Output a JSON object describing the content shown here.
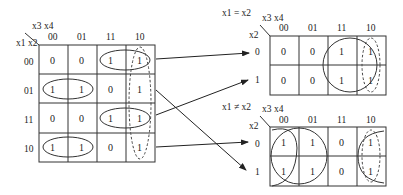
{
  "main_map": {
    "corner_cols_label": "x3 x4",
    "corner_rows_label": "x1 x2",
    "col_headers": [
      "00",
      "01",
      "11",
      "10"
    ],
    "row_headers": [
      "00",
      "01",
      "11",
      "10"
    ],
    "cells": [
      [
        "0",
        "0",
        "1",
        "1"
      ],
      [
        "1",
        "1",
        "0",
        "1"
      ],
      [
        "0",
        "0",
        "1",
        "1"
      ],
      [
        "1",
        "1",
        "0",
        "1"
      ]
    ]
  },
  "top_map": {
    "title": "x1 = x2",
    "corner_cols_label": "x3 x4",
    "corner_rows_label": "x2",
    "col_headers": [
      "00",
      "01",
      "11",
      "10"
    ],
    "row_headers": [
      "0",
      "1"
    ],
    "cells": [
      [
        "0",
        "0",
        "1",
        "1"
      ],
      [
        "0",
        "0",
        "1",
        "1"
      ]
    ]
  },
  "bottom_map": {
    "title": "x1 ≠ x2",
    "corner_cols_label": "x3 x4",
    "corner_rows_label": "x2",
    "col_headers": [
      "00",
      "01",
      "11",
      "10"
    ],
    "row_headers": [
      "0",
      "1"
    ],
    "cells": [
      [
        "1",
        "1",
        "0",
        "1"
      ],
      [
        "1",
        "1",
        "0",
        "1"
      ]
    ]
  },
  "arrows": [
    {
      "from": "main row 00",
      "to": "top_map row 0"
    },
    {
      "from": "main row 11",
      "to": "top_map row 1"
    },
    {
      "from": "main row 01",
      "to": "bottom_map row 1"
    },
    {
      "from": "main row 10",
      "to": "bottom_map row 0"
    }
  ],
  "colors": {
    "line": "#333333",
    "text": "#222222",
    "background": "#ffffff"
  }
}
